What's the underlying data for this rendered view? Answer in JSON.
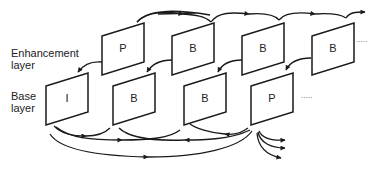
{
  "layers": {
    "enhancement": {
      "label_line1": "Enhancement",
      "label_line2": "layer",
      "frames": [
        {
          "type": "P"
        },
        {
          "type": "B"
        },
        {
          "type": "B"
        },
        {
          "type": "B"
        }
      ],
      "continuation": "....."
    },
    "base": {
      "label_line1": "Base",
      "label_line2": "layer",
      "frames": [
        {
          "type": "I"
        },
        {
          "type": "B"
        },
        {
          "type": "B"
        },
        {
          "type": "P"
        }
      ],
      "continuation": "....."
    }
  },
  "colors": {
    "stroke": "#1a1a1a",
    "background": "#ffffff"
  }
}
